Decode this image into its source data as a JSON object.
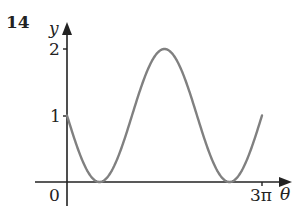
{
  "question_number": "14",
  "chart_data": {
    "type": "line",
    "title": "",
    "function": "y = 1 - sin(theta)",
    "xlabel": "θ",
    "ylabel": "y",
    "origin_label": "0",
    "x_ticks": [
      {
        "value": 9.42477796,
        "label": "3π"
      }
    ],
    "y_ticks": [
      {
        "value": 1,
        "label": "1"
      },
      {
        "value": 2,
        "label": "2"
      }
    ],
    "xlim": [
      0,
      9.42477796
    ],
    "ylim": [
      0,
      2
    ],
    "grid": false,
    "series": [
      {
        "name": "curve",
        "color": "#808080",
        "x": [
          0,
          1.5708,
          3.1416,
          4.7124,
          6.2832,
          7.854,
          9.4248
        ],
        "x_labels": [
          "0",
          "π/2",
          "π",
          "3π/2",
          "2π",
          "5π/2",
          "3π"
        ],
        "values": [
          1,
          0,
          1,
          2,
          1,
          0,
          1
        ]
      }
    ]
  },
  "labels": {
    "y_axis": "y",
    "x_axis": "θ",
    "origin": "0",
    "tick_y1": "1",
    "tick_y2": "2",
    "tick_x_end": "3π"
  }
}
